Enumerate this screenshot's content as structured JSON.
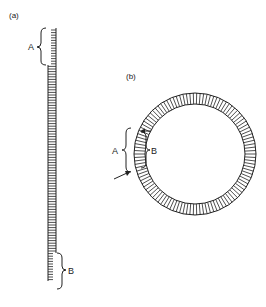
{
  "figure": {
    "panel_a": {
      "label": "(a)",
      "brace_top_label": "A",
      "brace_bottom_label": "B",
      "description": "Linear striated strip; segment A at top has only right border, segment B at bottom has only left border"
    },
    "panel_b": {
      "label": "(b)",
      "brace_outer_label": "A",
      "brace_inner_label": "B",
      "description": "Striated ring (closed loop) with arrows marking a segment; A brace outside, B brace inside"
    },
    "colors": {
      "ink": "#222222",
      "background": "#ffffff"
    }
  }
}
